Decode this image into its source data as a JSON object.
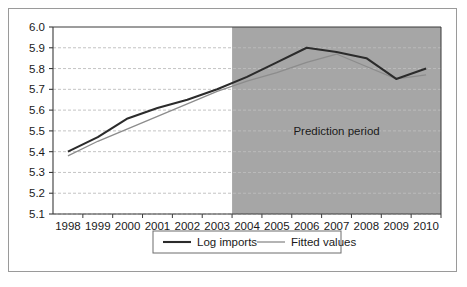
{
  "chart_data": {
    "type": "line",
    "title": "",
    "xlabel": "",
    "ylabel": "",
    "categories": [
      "1998",
      "1999",
      "2000",
      "2001",
      "2002",
      "2003",
      "2004",
      "2005",
      "2006",
      "2007",
      "2008",
      "2009",
      "2010"
    ],
    "ylim": [
      5.1,
      6.0
    ],
    "ytick_labels": [
      "6.0",
      "5.9",
      "5.8",
      "5.7",
      "5.6",
      "5.5",
      "5.4",
      "5.3",
      "5.2",
      "5.1"
    ],
    "ytick_values": [
      6.0,
      5.9,
      5.8,
      5.7,
      5.6,
      5.5,
      5.4,
      5.3,
      5.2,
      5.1
    ],
    "grid": true,
    "grid_style": "dashed-horizontal",
    "legend_position": "bottom-center",
    "series": [
      {
        "name": "Log imports",
        "color": "#2b2b2b",
        "width": 2.1,
        "values": [
          5.4,
          5.47,
          5.56,
          5.61,
          5.65,
          5.7,
          5.76,
          5.83,
          5.9,
          5.88,
          5.85,
          5.75,
          5.8
        ]
      },
      {
        "name": "Fitted values",
        "color": "#8c8c8c",
        "width": 1.3,
        "values": [
          5.38,
          5.45,
          5.51,
          5.57,
          5.63,
          5.69,
          5.74,
          5.78,
          5.83,
          5.87,
          5.81,
          5.75,
          5.77
        ]
      }
    ],
    "annotations": [
      {
        "text": "Prediction period",
        "x_category": "2007",
        "y": 5.5
      }
    ],
    "shaded_region": {
      "label": "Prediction period",
      "start_category": "2004",
      "end_category": "2010",
      "color": "#a6a6a6"
    }
  },
  "legend": {
    "items": [
      {
        "label": "Log imports"
      },
      {
        "label": "Fitted values"
      }
    ]
  },
  "colors": {
    "plot_background": "#ffffff",
    "shade": "#a6a6a6",
    "gridline": "#bdbdbd",
    "axis": "#3a3a3a",
    "frame": "#9a9a9a",
    "series_primary": "#2b2b2b",
    "series_secondary": "#8c8c8c"
  }
}
